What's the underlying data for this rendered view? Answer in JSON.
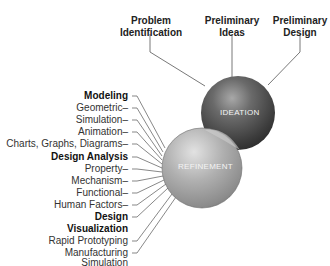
{
  "diagram": {
    "top_labels": [
      {
        "line1": "Problem",
        "line2": "Identification"
      },
      {
        "line1": "Preliminary",
        "line2": "Ideas"
      },
      {
        "line1": "Preliminary",
        "line2": "Design"
      }
    ],
    "spheres": {
      "ideation": "IDEATION",
      "refinement": "REFINEMENT"
    },
    "left_labels": [
      {
        "text": "Modeling",
        "bold": true
      },
      {
        "text": "Geometric–",
        "bold": false
      },
      {
        "text": "Simulation–",
        "bold": false
      },
      {
        "text": "Animation–",
        "bold": false
      },
      {
        "text": "Charts, Graphs, Diagrams–",
        "bold": false
      },
      {
        "text": "Design Analysis",
        "bold": true
      },
      {
        "text": "Property–",
        "bold": false
      },
      {
        "text": "Mechanism–",
        "bold": false
      },
      {
        "text": "Functional–",
        "bold": false
      },
      {
        "text": "Human Factors–",
        "bold": false
      },
      {
        "text": "Design",
        "bold": true
      },
      {
        "text": "Visualization",
        "bold": true
      },
      {
        "text": "Rapid Prototyping",
        "bold": false
      },
      {
        "text": "Manufacturing",
        "bold": false
      },
      {
        "text": "Simulation",
        "bold": false
      }
    ],
    "colors": {
      "ideation_dark": "#3a3a3a",
      "refinement_light": "#9a9a9a",
      "line": "#555555"
    }
  }
}
